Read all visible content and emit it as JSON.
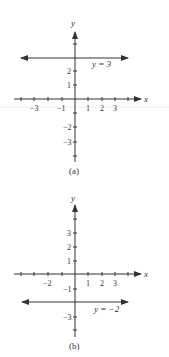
{
  "figures": [
    {
      "id": "a",
      "caption": "(a)",
      "axis_x_label": "x",
      "axis_y_label": "y",
      "line_label": "y = 3",
      "line_value": 3,
      "x_tick_labels": [
        "-3",
        "-1",
        "1",
        "2",
        "3"
      ],
      "y_tick_labels": [
        "2",
        "1",
        "-2",
        "-3"
      ]
    },
    {
      "id": "b",
      "caption": "(b)",
      "axis_x_label": "x",
      "axis_y_label": "y",
      "line_label": "y = −2",
      "line_value": -2,
      "x_tick_labels": [
        "-2",
        "1",
        "2",
        "3"
      ],
      "y_tick_labels": [
        "3",
        "2",
        "1",
        "-1",
        "-3"
      ]
    }
  ],
  "colors": {
    "ink": "#333333",
    "background": "#ffffff"
  }
}
